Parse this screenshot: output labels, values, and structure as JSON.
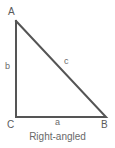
{
  "figure": {
    "caption": "Right-angled",
    "shape_name": "right-angled-triangle",
    "background_color": "#ffffff",
    "stroke_color": "#555555",
    "label_color": "#5a5a5a",
    "caption_color": "#696969",
    "stroke_width": 2,
    "vertices": [
      {
        "name": "A",
        "label": "A",
        "x": 16,
        "y": 21
      },
      {
        "name": "B",
        "label": "B",
        "x": 106,
        "y": 117
      },
      {
        "name": "C",
        "label": "C",
        "x": 16,
        "y": 117
      }
    ],
    "sides": [
      {
        "name": "a",
        "label": "a",
        "from": "C",
        "to": "B",
        "position": "bottom"
      },
      {
        "name": "b",
        "label": "b",
        "from": "A",
        "to": "C",
        "position": "left"
      },
      {
        "name": "c",
        "label": "c",
        "from": "A",
        "to": "B",
        "position": "hypotenuse"
      }
    ]
  }
}
